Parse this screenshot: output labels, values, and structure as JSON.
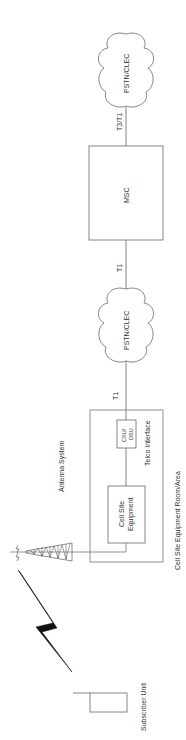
{
  "diagram": {
    "nodes": {
      "pstn_top": {
        "label": "PSTN/CLEC"
      },
      "msc": {
        "label": "MSC"
      },
      "pstn_mid": {
        "label": "PSTN/CLEC"
      },
      "csu_dsu": {
        "label_line1": "CSU/",
        "label_line2": "DSU"
      },
      "cell_site_equipment": {
        "label_line1": "Cell Site",
        "label_line2": "Equipment"
      },
      "telco_interface": {
        "label": "Telco Interface"
      },
      "equipment_room": {
        "label": "Cell Site Equipment Room/Area"
      },
      "antenna_system": {
        "label": "Antenna System"
      },
      "subscriber_unit": {
        "label": "Subscriber Unit"
      }
    },
    "links": {
      "msc_to_pstn_top": {
        "label": "T3/T1"
      },
      "pstn_mid_to_msc": {
        "label": "T1"
      },
      "csu_to_pstn_mid": {
        "label": "T1"
      }
    },
    "colors": {
      "line": "#555555",
      "text": "#333333",
      "bolt": "#111111"
    }
  }
}
